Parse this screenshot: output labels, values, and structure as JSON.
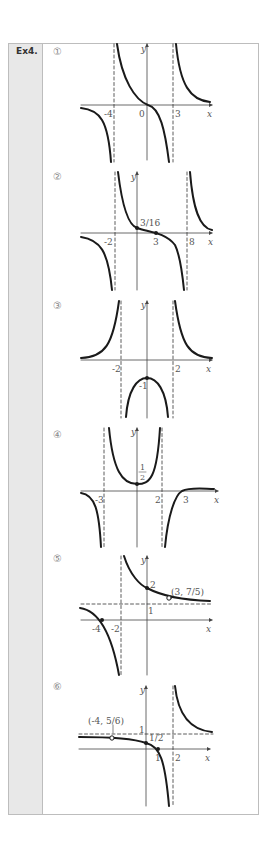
{
  "exercise": {
    "label": "Ex4."
  },
  "plots": [
    {
      "number": "①",
      "labels": {
        "y": "y",
        "x": "x",
        "a": "-4",
        "b": "0",
        "c": "3"
      }
    },
    {
      "number": "②",
      "labels": {
        "y": "y",
        "x": "x",
        "a": "-2",
        "b": "3",
        "c": "8",
        "point": "3/16"
      }
    },
    {
      "number": "③",
      "labels": {
        "y": "y",
        "x": "x",
        "a": "-2",
        "b": "2",
        "vertex": "-1"
      }
    },
    {
      "number": "④",
      "labels": {
        "y": "y",
        "x": "x",
        "a": "-3",
        "b": "2",
        "c": "3",
        "num": "1",
        "den": "2"
      }
    },
    {
      "number": "⑤",
      "labels": {
        "y": "y",
        "x": "x",
        "a": "-4",
        "b": "-2",
        "yint": "2",
        "hasym": "1",
        "hole": "(3, 7/5)"
      }
    },
    {
      "number": "⑥",
      "labels": {
        "y": "y",
        "x": "x",
        "hole": "(-4, 5/6)",
        "hasym": "1",
        "yint": "1/2",
        "zero": "1",
        "vasym": "2"
      }
    }
  ],
  "colors": {
    "curve": "#1a1a1a",
    "axis": "#444444",
    "sidebar": "#e8e8e8",
    "border": "#bdbdbd"
  }
}
